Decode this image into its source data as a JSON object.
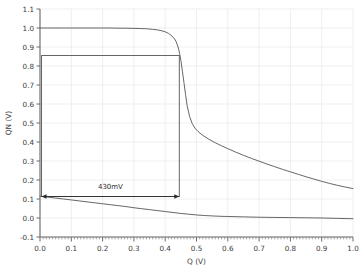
{
  "chart_data": {
    "type": "line",
    "title": "",
    "xlabel": "Q (V)",
    "ylabel": "QN (V)",
    "xlim": [
      0.0,
      1.0
    ],
    "ylim": [
      -0.1,
      1.1
    ],
    "xticks": [
      "0.0",
      "0.1",
      "0.2",
      "0.3",
      "0.4",
      "0.5",
      "0.6",
      "0.7",
      "0.8",
      "0.9",
      "1.0"
    ],
    "xtick_values": [
      0.0,
      0.1,
      0.2,
      0.3,
      0.4,
      0.5,
      0.6,
      0.7,
      0.8,
      0.9,
      1.0
    ],
    "yticks": [
      "-0.1",
      "0.0",
      "0.1",
      "0.2",
      "0.3",
      "0.4",
      "0.5",
      "0.6",
      "0.7",
      "0.8",
      "0.9",
      "1.0",
      "1.1"
    ],
    "ytick_values": [
      -0.1,
      0.0,
      0.1,
      0.2,
      0.3,
      0.4,
      0.5,
      0.6,
      0.7,
      0.8,
      0.9,
      1.0,
      1.1
    ],
    "grid": true,
    "grid_color": "#e8e8ec",
    "minor_ticks_x": true,
    "legend": null,
    "line_color": "#555555",
    "axis_color": "#6b6b6b",
    "series": [
      {
        "name": "butterfly-curve-upper",
        "comment": "SRAM VTC: QN vs Q, high-to-low transfer",
        "x": [
          0.0,
          0.025,
          0.05,
          0.075,
          0.1,
          0.125,
          0.15,
          0.175,
          0.2,
          0.225,
          0.25,
          0.275,
          0.3,
          0.32,
          0.34,
          0.36,
          0.375,
          0.39,
          0.4,
          0.41,
          0.418,
          0.425,
          0.43,
          0.435,
          0.44,
          0.443,
          0.446,
          0.45,
          0.455,
          0.46,
          0.465,
          0.47,
          0.478,
          0.486,
          0.495,
          0.505,
          0.52,
          0.54,
          0.56,
          0.58,
          0.6,
          0.625,
          0.65,
          0.675,
          0.7,
          0.725,
          0.75,
          0.775,
          0.8,
          0.825,
          0.85,
          0.875,
          0.9,
          0.925,
          0.95,
          0.975,
          1.0
        ],
        "y": [
          1.0,
          1.0,
          1.0,
          1.0,
          1.0,
          1.0,
          1.0,
          1.0,
          1.0,
          1.0,
          0.999,
          0.999,
          0.998,
          0.997,
          0.996,
          0.993,
          0.99,
          0.985,
          0.98,
          0.972,
          0.963,
          0.952,
          0.942,
          0.928,
          0.905,
          0.888,
          0.866,
          0.83,
          0.772,
          0.712,
          0.65,
          0.592,
          0.534,
          0.498,
          0.473,
          0.455,
          0.435,
          0.414,
          0.396,
          0.38,
          0.365,
          0.347,
          0.33,
          0.314,
          0.299,
          0.284,
          0.27,
          0.256,
          0.243,
          0.23,
          0.217,
          0.205,
          0.193,
          0.182,
          0.172,
          0.163,
          0.155
        ]
      },
      {
        "name": "butterfly-curve-lower",
        "comment": "SRAM VTC: mirrored transfer curve, low branch",
        "x": [
          0.0,
          0.025,
          0.05,
          0.075,
          0.1,
          0.125,
          0.15,
          0.175,
          0.2,
          0.225,
          0.25,
          0.275,
          0.3,
          0.325,
          0.35,
          0.375,
          0.4,
          0.425,
          0.45,
          0.475,
          0.5,
          0.525,
          0.55,
          0.575,
          0.6,
          0.65,
          0.7,
          0.75,
          0.8,
          0.85,
          0.9,
          0.95,
          1.0
        ],
        "y": [
          0.115,
          0.11,
          0.105,
          0.1,
          0.095,
          0.09,
          0.085,
          0.08,
          0.075,
          0.07,
          0.065,
          0.06,
          0.054,
          0.049,
          0.044,
          0.039,
          0.034,
          0.029,
          0.024,
          0.02,
          0.016,
          0.013,
          0.011,
          0.009,
          0.008,
          0.006,
          0.004,
          0.003,
          0.002,
          0.001,
          0.0,
          -0.002,
          -0.004
        ]
      }
    ],
    "annotations": [
      {
        "name": "snm-box",
        "type": "rectangle",
        "x0": 0.005,
        "x1": 0.445,
        "y0": 0.113,
        "y1": 0.855,
        "stroke": "#555555"
      },
      {
        "name": "snm-arrow",
        "type": "double-arrow",
        "label": "430mV",
        "x0": 0.005,
        "x1": 0.445,
        "y": 0.113,
        "label_x": 0.225,
        "label_y": 0.155
      }
    ]
  },
  "figure": {
    "background": "#ffffff",
    "plot_left_px": 40,
    "plot_right_px": 353,
    "plot_top_px": 9,
    "plot_bottom_px": 237
  }
}
